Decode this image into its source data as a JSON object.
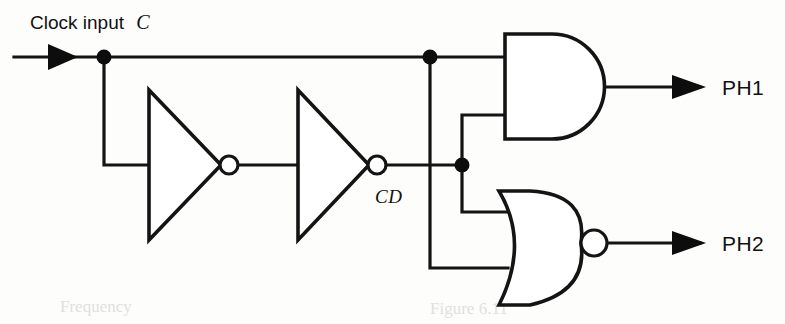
{
  "figure": {
    "width": 785,
    "height": 324,
    "background_color": "#fdfdfc",
    "ink_color": "#141414"
  },
  "labels": {
    "clock_input_prefix": "Clock input",
    "clock_input_signal": "C",
    "delayed_clock": "CD",
    "output_1": "PH1",
    "output_2": "PH2"
  },
  "components": [
    {
      "id": "inverter-1",
      "type": "inverter",
      "label": "first inverter",
      "input_from": "C",
      "output_to": "inverter-2"
    },
    {
      "id": "inverter-2",
      "type": "inverter",
      "label": "second inverter",
      "input_from": "inverter-1",
      "output_to": "CD"
    },
    {
      "id": "and-gate",
      "type": "and",
      "label": "AND gate",
      "inputs": [
        "C",
        "CD"
      ],
      "output": "PH1"
    },
    {
      "id": "nor-gate",
      "type": "nor",
      "label": "NOR gate",
      "inputs": [
        "CD",
        "C"
      ],
      "output": "PH2"
    }
  ],
  "nets": [
    {
      "id": "net-c",
      "name": "C",
      "from": "clock input",
      "to": [
        "inverter-1",
        "and-gate",
        "nor-gate"
      ]
    },
    {
      "id": "net-cd",
      "name": "CD",
      "from": "inverter-2",
      "to": [
        "and-gate",
        "nor-gate"
      ]
    },
    {
      "id": "net-ph1",
      "name": "PH1",
      "from": "and-gate",
      "to": "output"
    },
    {
      "id": "net-ph2",
      "name": "PH2",
      "from": "nor-gate",
      "to": "output"
    }
  ],
  "junctions": [
    {
      "id": "junction-clock-fanout",
      "x": 104,
      "y": 57
    },
    {
      "id": "junction-clock-gates",
      "x": 430,
      "y": 57
    },
    {
      "id": "junction-cd-fanout",
      "x": 462,
      "y": 165
    }
  ],
  "geometry": {
    "clock_line_y": 57,
    "mid_line_y": 165,
    "ph1_out_y": 87,
    "ph2_out_y": 243,
    "and_input_hi_y": 57,
    "and_input_lo_y": 118,
    "nor_input_hi_y": 212,
    "nor_input_lo_y": 268
  },
  "bleed_through": {
    "left_fragment": "Frequency",
    "right_fragment": "Figure 6.11"
  }
}
